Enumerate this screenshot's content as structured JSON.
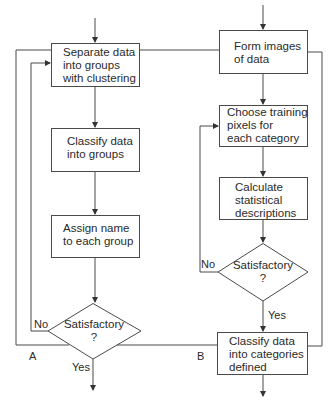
{
  "diagram": {
    "type": "flowchart",
    "left_flow": {
      "boxes": [
        {
          "id": "separate",
          "label": "Separate data\ninto groups\nwith clustering"
        },
        {
          "id": "classify_groups",
          "label": "Classify data\ninto groups"
        },
        {
          "id": "assign_name",
          "label": "Assign name\nto each group"
        }
      ],
      "decision": {
        "label": "Satisfactory\n?",
        "no_label": "No",
        "yes_label": "Yes"
      },
      "marker": "A"
    },
    "right_flow": {
      "boxes": [
        {
          "id": "form_images",
          "label": "Form images\nof data"
        },
        {
          "id": "choose_training",
          "label": "Choose training\npixels for\neach category"
        },
        {
          "id": "calculate",
          "label": "Calculate\nstatistical\ndescriptions"
        },
        {
          "id": "classify_categories",
          "label": "Classify data\ninto categories\ndefined"
        }
      ],
      "decision": {
        "label": "Satisfactory\n?",
        "no_label": "No",
        "yes_label": "Yes"
      },
      "marker": "B"
    },
    "colors": {
      "line": "#4a4a4a",
      "text": "#2a2a2a",
      "background": "#ffffff"
    }
  }
}
